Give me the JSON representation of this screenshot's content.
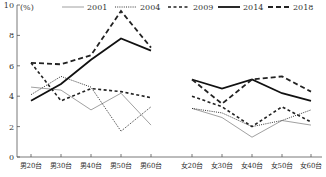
{
  "chart_data": {
    "type": "line",
    "title": "",
    "xlabel": "",
    "ylabel": "(%)",
    "ylim": [
      0,
      10
    ],
    "yticks": [
      0,
      2,
      4,
      6,
      8,
      10
    ],
    "grid": false,
    "legend_position": "top",
    "panels": [
      {
        "name": "male",
        "categories": [
          "男20台",
          "男30台",
          "男40台",
          "男50台",
          "男60台"
        ]
      },
      {
        "name": "female",
        "categories": [
          "女20台",
          "女30台",
          "女40台",
          "女50台",
          "女60台"
        ]
      }
    ],
    "categories": [
      "男20台",
      "男30台",
      "男40台",
      "男50台",
      "男60台",
      "女20台",
      "女30台",
      "女40台",
      "女50台",
      "女60台"
    ],
    "series": [
      {
        "name": "2001",
        "style": "thin-solid",
        "values": [
          4.6,
          4.4,
          3.1,
          4.2,
          2.1,
          3.2,
          2.6,
          1.3,
          2.4,
          2.1
        ]
      },
      {
        "name": "2004",
        "style": "dotted",
        "values": [
          4.1,
          5.3,
          4.6,
          1.7,
          3.3,
          3.2,
          2.9,
          2.0,
          2.4,
          3.1
        ]
      },
      {
        "name": "2009",
        "style": "short-dash",
        "values": [
          6.2,
          3.7,
          4.5,
          4.3,
          3.9,
          4.0,
          3.3,
          2.0,
          3.3,
          2.3
        ]
      },
      {
        "name": "2014",
        "style": "thick-solid",
        "values": [
          3.7,
          4.8,
          6.4,
          7.8,
          7.0,
          5.1,
          4.5,
          5.1,
          4.2,
          3.7
        ]
      },
      {
        "name": "2018",
        "style": "long-dash",
        "values": [
          6.2,
          6.1,
          6.7,
          9.6,
          7.2,
          5.1,
          3.5,
          5.1,
          5.3,
          4.3
        ]
      }
    ]
  },
  "axis": {
    "unit_label": "(%)",
    "y_ticks": [
      "0",
      "2",
      "4",
      "6",
      "8",
      "10"
    ]
  },
  "legend": {
    "items": [
      "2001",
      "2004",
      "2009",
      "2014",
      "2018"
    ]
  },
  "x_labels": [
    "男20台",
    "男30台",
    "男40台",
    "男50台",
    "男60台",
    "女20台",
    "女30台",
    "女40台",
    "女50台",
    "女60台"
  ]
}
